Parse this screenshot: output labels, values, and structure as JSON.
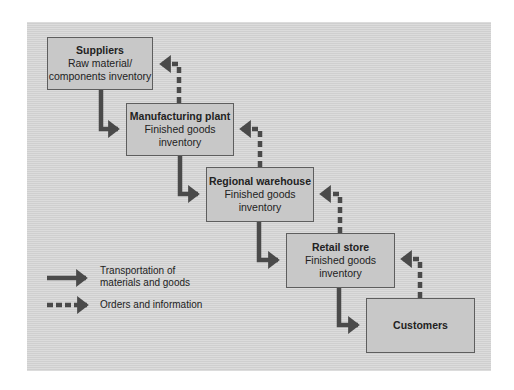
{
  "diagram": {
    "nodes": [
      {
        "id": "suppliers",
        "title": "Suppliers",
        "lines": [
          "Raw material/",
          "components inventory"
        ]
      },
      {
        "id": "manufacturing",
        "title": "Manufacturing plant",
        "lines": [
          "Finished goods",
          "inventory"
        ]
      },
      {
        "id": "warehouse",
        "title": "Regional warehouse",
        "lines": [
          "Finished goods",
          "inventory"
        ]
      },
      {
        "id": "retail",
        "title": "Retail store",
        "lines": [
          "Finished goods",
          "inventory"
        ]
      },
      {
        "id": "customers",
        "title": "Customers",
        "lines": []
      }
    ],
    "edges": [
      {
        "from": "suppliers",
        "to": "manufacturing",
        "type": "solid"
      },
      {
        "from": "manufacturing",
        "to": "warehouse",
        "type": "solid"
      },
      {
        "from": "warehouse",
        "to": "retail",
        "type": "solid"
      },
      {
        "from": "retail",
        "to": "customers",
        "type": "solid"
      },
      {
        "from": "manufacturing",
        "to": "suppliers",
        "type": "dashed"
      },
      {
        "from": "warehouse",
        "to": "manufacturing",
        "type": "dashed"
      },
      {
        "from": "retail",
        "to": "warehouse",
        "type": "dashed"
      },
      {
        "from": "customers",
        "to": "retail",
        "type": "dashed"
      }
    ],
    "legend": {
      "solid_line1": "Transportation of",
      "solid_line2": "materials and goods",
      "dashed": "Orders and information"
    },
    "colors": {
      "arrow": "#4a4a4a",
      "box_fill": "#c8c8c8",
      "panel": "#d6d6d6"
    }
  }
}
